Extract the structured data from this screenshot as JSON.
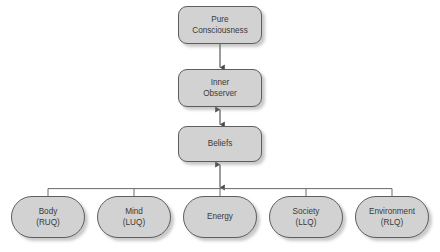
{
  "diagram": {
    "background_color": "#ffffff",
    "node_fill_color": "#d2d2d2",
    "node_border_color": "#5e5e5e",
    "connector_color": "#4a4a4a",
    "text_color": "#3a3a3a",
    "chain": [
      {
        "id": "pure-consciousness",
        "shape": "rounded-rectangle",
        "line1": "Pure",
        "line2": "Consciousness"
      },
      {
        "id": "inner-observer",
        "shape": "rounded-rectangle",
        "line1": "Inner",
        "line2": "Observer"
      },
      {
        "id": "beliefs",
        "shape": "rounded-rectangle",
        "line1": "Beliefs",
        "line2": ""
      }
    ],
    "quadrants": [
      {
        "id": "body",
        "shape": "ellipse",
        "line1": "Body",
        "line2": "(RUQ)"
      },
      {
        "id": "mind",
        "shape": "ellipse",
        "line1": "Mind",
        "line2": "(LUQ)"
      },
      {
        "id": "energy",
        "shape": "ellipse",
        "line1": "Energy",
        "line2": ""
      },
      {
        "id": "society",
        "shape": "ellipse",
        "line1": "Society",
        "line2": "(LLQ)"
      },
      {
        "id": "environment",
        "shape": "ellipse",
        "line1": "Environment",
        "line2": "(RLQ)"
      }
    ],
    "connectors": [
      {
        "id": "pure-consciousness-to-inner-observer",
        "from": "pure-consciousness",
        "to": "inner-observer",
        "direction": "down"
      },
      {
        "id": "inner-observer-to-beliefs",
        "from": "inner-observer",
        "to": "beliefs",
        "direction": "bidirectional"
      },
      {
        "id": "beliefs-to-quadrant-bus",
        "from": "beliefs",
        "to": "quadrant-bus",
        "direction": "bidirectional"
      }
    ]
  }
}
